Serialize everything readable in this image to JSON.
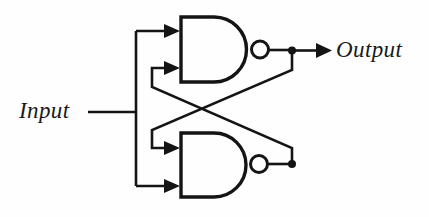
{
  "diagram": {
    "type": "logic-circuit-schematic",
    "background_color": "#fefefe",
    "line_color": "#141414"
  },
  "labels": {
    "input": "Input",
    "output": "Output"
  },
  "components": {
    "gates": [
      {
        "id": "nand-gate-top",
        "name": "NAND",
        "symbol": "AND-body-with-inversion-bubble",
        "inputs": 2,
        "outputs": 1
      },
      {
        "id": "nand-gate-bottom",
        "name": "NAND",
        "symbol": "AND-body-with-inversion-bubble",
        "inputs": 2,
        "outputs": 1
      }
    ],
    "junctions": [
      {
        "id": "junction-top-output",
        "label": ""
      },
      {
        "id": "junction-bottom-output",
        "label": ""
      }
    ],
    "nets": [
      {
        "id": "input-bus",
        "from": "Input",
        "to": "gate inputs"
      },
      {
        "id": "cross-couple-top-to-bottom",
        "from": "nand-gate-top output",
        "to": "nand-gate-bottom input"
      },
      {
        "id": "cross-couple-bottom-to-top",
        "from": "nand-gate-bottom output",
        "to": "nand-gate-top input"
      },
      {
        "id": "output-net",
        "from": "nand-gate-top output",
        "to": "Output"
      }
    ]
  }
}
